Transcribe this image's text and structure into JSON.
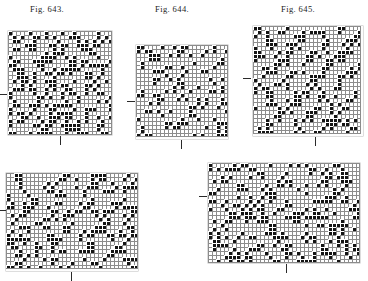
{
  "page": {
    "background_color": "#ffffff",
    "ink_color": "#1b1b1b",
    "filled_cell_color": "#141414",
    "empty_cell_color": "#ffffff",
    "cell_border_color": "#8c8c8c",
    "cell_size_px": 4
  },
  "captions": [
    {
      "name": "fig-643-caption",
      "prefix": "Fig.",
      "number": "643.",
      "text": "Fig. 643.",
      "x": 30,
      "y": 4
    },
    {
      "name": "fig-644-caption",
      "prefix": "Fig.",
      "number": "644.",
      "text": "Fig. 644.",
      "x": 155,
      "y": 4
    },
    {
      "name": "fig-645-caption",
      "prefix": "Fig.",
      "number": "645.",
      "text": "Fig. 645.",
      "x": 281,
      "y": 4
    }
  ],
  "figures": [
    {
      "id": "fig-643",
      "label": "Fig. 643.",
      "x": 8,
      "y": 31,
      "width": 104,
      "height": 104,
      "cols": 26,
      "rows": 26,
      "cell": 4,
      "motif": "twill-diamond",
      "seed": 6431,
      "density": 0.3,
      "ticks": [
        {
          "name": "repeat-tick-left",
          "orientation": "horizontal",
          "x": -9,
          "y": 63
        },
        {
          "name": "repeat-tick-bottom",
          "orientation": "vertical",
          "x": 52,
          "y": 105
        }
      ]
    },
    {
      "id": "fig-644",
      "label": "Fig. 644.",
      "x": 136,
      "y": 45,
      "width": 92,
      "height": 94,
      "cols": 23,
      "rows": 23,
      "cell": 4,
      "motif": "diagonal-lattice",
      "seed": 6442,
      "density": 0.28,
      "ticks": [
        {
          "name": "repeat-tick-left",
          "orientation": "horizontal",
          "x": -9,
          "y": 56
        },
        {
          "name": "repeat-tick-bottom",
          "orientation": "vertical",
          "x": 45,
          "y": 95
        }
      ]
    },
    {
      "id": "fig-645",
      "label": "Fig. 645.",
      "x": 253,
      "y": 26,
      "width": 110,
      "height": 110,
      "cols": 27,
      "rows": 27,
      "cell": 4,
      "motif": "broken-diamond",
      "seed": 6453,
      "density": 0.31,
      "ticks": [
        {
          "name": "repeat-tick-left",
          "orientation": "horizontal",
          "x": -10,
          "y": 52
        },
        {
          "name": "repeat-tick-bottom",
          "orientation": "vertical",
          "x": 62,
          "y": 111
        }
      ]
    },
    {
      "id": "fig-lower-left",
      "label": "",
      "x": 6,
      "y": 173,
      "width": 132,
      "height": 98,
      "cols": 33,
      "rows": 24,
      "cell": 4,
      "motif": "zigzag-twill",
      "seed": 6464,
      "density": 0.29,
      "ticks": [
        {
          "name": "repeat-tick-left",
          "orientation": "horizontal",
          "x": -8,
          "y": 37
        },
        {
          "name": "repeat-tick-bottom",
          "orientation": "vertical",
          "x": 65,
          "y": 99
        }
      ]
    },
    {
      "id": "fig-lower-right",
      "label": "",
      "x": 208,
      "y": 163,
      "width": 152,
      "height": 100,
      "cols": 38,
      "rows": 25,
      "cell": 4,
      "motif": "ogee-diamond",
      "seed": 6475,
      "density": 0.3,
      "ticks": [
        {
          "name": "repeat-tick-left",
          "orientation": "horizontal",
          "x": -9,
          "y": 33
        },
        {
          "name": "repeat-tick-bottom",
          "orientation": "vertical",
          "x": 78,
          "y": 101
        }
      ]
    }
  ]
}
